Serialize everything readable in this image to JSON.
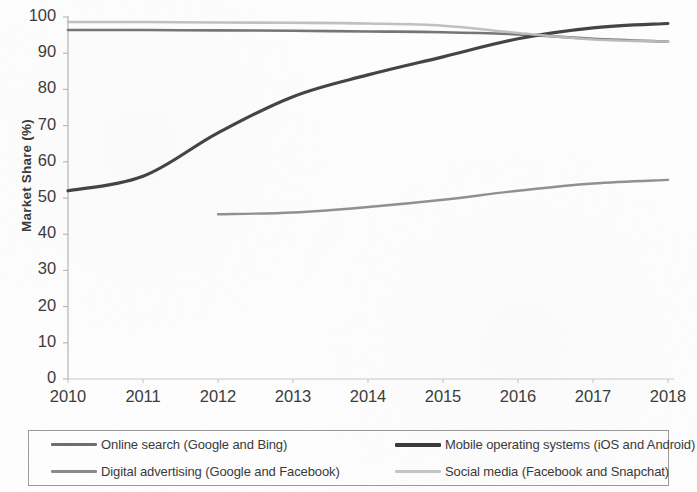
{
  "chart_data": {
    "type": "line",
    "title": "",
    "xlabel": "",
    "ylabel": "Market Share (%)",
    "xlim": [
      2010,
      2018
    ],
    "ylim": [
      0,
      100
    ],
    "grid": false,
    "legend_position": "bottom",
    "x": [
      2010,
      2011,
      2012,
      2013,
      2014,
      2015,
      2016,
      2017,
      2018
    ],
    "xtick_labels": [
      "2010",
      "2011",
      "2012",
      "2013",
      "2014",
      "2015",
      "2016",
      "2017",
      "2018"
    ],
    "ytick_labels": [
      "0",
      "10",
      "20",
      "30",
      "40",
      "50",
      "60",
      "70",
      "80",
      "90",
      "100"
    ],
    "ytick_values": [
      0,
      10,
      20,
      30,
      40,
      50,
      60,
      70,
      80,
      90,
      100
    ],
    "series": [
      {
        "name": "Online search (Google and Bing)",
        "color": "#6e6e6e",
        "width": 2.6,
        "x": [
          2010,
          2011,
          2012,
          2013,
          2014,
          2015,
          2016,
          2017,
          2018
        ],
        "values": [
          96.4,
          96.4,
          96.3,
          96.2,
          96.0,
          95.8,
          95.2,
          94.0,
          93.2
        ]
      },
      {
        "name": "Mobile operating systems (iOS and Android)",
        "color": "#3a3a3a",
        "width": 3.2,
        "x": [
          2010,
          2011,
          2012,
          2013,
          2014,
          2015,
          2016,
          2017,
          2018
        ],
        "values": [
          52.0,
          56.0,
          68.0,
          78.0,
          84.0,
          89.0,
          94.0,
          97.0,
          98.2
        ]
      },
      {
        "name": "Digital advertising (Google and Facebook)",
        "color": "#8a8a8a",
        "width": 2.4,
        "x": [
          2012,
          2013,
          2014,
          2015,
          2016,
          2017,
          2018
        ],
        "values": [
          45.5,
          46.0,
          47.5,
          49.5,
          52.0,
          54.0,
          55.0
        ]
      },
      {
        "name": "Social media (Facebook and Snapchat)",
        "color": "#bdbdbd",
        "width": 2.6,
        "x": [
          2010,
          2011,
          2012,
          2013,
          2014,
          2015,
          2016,
          2017,
          2018
        ],
        "values": [
          98.6,
          98.6,
          98.5,
          98.4,
          98.2,
          97.6,
          95.6,
          93.8,
          93.2
        ]
      }
    ]
  },
  "axes": {
    "y_title": "Market Share (%)"
  },
  "legend": {
    "entries": [
      {
        "label": "Online search (Google and Bing)",
        "color": "#6e6e6e",
        "width": 3
      },
      {
        "label": "Mobile operating systems (iOS and Android)",
        "color": "#3a3a3a",
        "width": 4
      },
      {
        "label": "Digital advertising (Google and Facebook)",
        "color": "#8a8a8a",
        "width": 3
      },
      {
        "label": "Social media (Facebook and Snapchat)",
        "color": "#c4c4c4",
        "width": 3
      }
    ]
  }
}
